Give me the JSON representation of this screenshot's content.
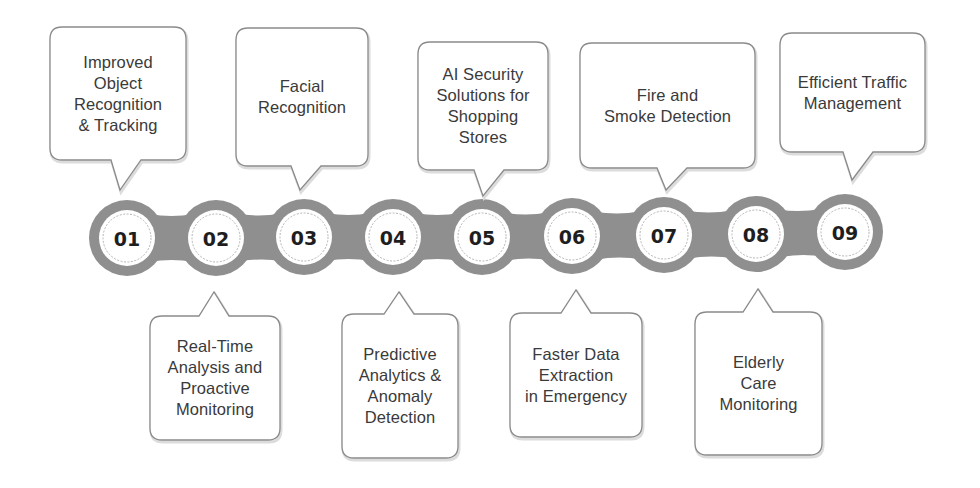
{
  "colors": {
    "chain": "#8f8f8f",
    "node_fill": "#ffffff",
    "node_ring": "#b5b5b5",
    "callout_border": "#8a8a8a",
    "text": "#3a3a3a",
    "number": "#1e1e1e"
  },
  "timeline": {
    "nodes": [
      {
        "number": "01",
        "label": "Improved\nObject\nRecognition\n& Tracking",
        "position": "above"
      },
      {
        "number": "02",
        "label": "Real-Time\nAnalysis and\nProactive\nMonitoring",
        "position": "below"
      },
      {
        "number": "03",
        "label": "Facial\nRecognition",
        "position": "above"
      },
      {
        "number": "04",
        "label": "Predictive\nAnalytics &\nAnomaly\nDetection",
        "position": "below"
      },
      {
        "number": "05",
        "label": "AI Security\nSolutions for\nShopping\nStores",
        "position": "above"
      },
      {
        "number": "06",
        "label": "Faster Data\nExtraction\nin Emergency",
        "position": "below"
      },
      {
        "number": "07",
        "label": "Fire and\nSmoke Detection",
        "position": "above"
      },
      {
        "number": "08",
        "label": "Elderly\nCare\nMonitoring",
        "position": "below"
      },
      {
        "number": "09",
        "label": "Efficient Traffic\nManagement",
        "position": "above"
      }
    ]
  }
}
